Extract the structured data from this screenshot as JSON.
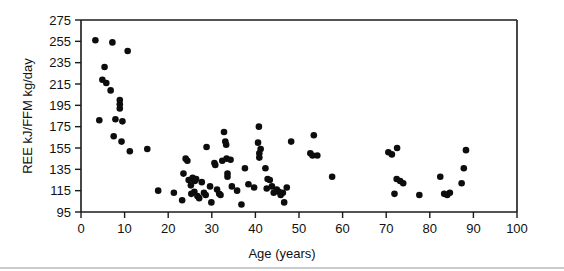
{
  "chart_data": {
    "type": "scatter",
    "title": "",
    "xlabel": "Age (years)",
    "ylabel": "REE kJ/FFM kg/day",
    "xlim": [
      0,
      100
    ],
    "ylim": [
      95,
      275
    ],
    "xticks": [
      0,
      10,
      20,
      30,
      40,
      50,
      60,
      70,
      80,
      90,
      100
    ],
    "yticks": [
      95,
      115,
      135,
      155,
      175,
      195,
      215,
      235,
      255,
      275
    ],
    "xtick_labels": [
      "0",
      "10",
      "20",
      "30",
      "40",
      "50",
      "60",
      "70",
      "80",
      "90",
      "100"
    ],
    "ytick_labels": [
      "95",
      "115",
      "135",
      "155",
      "175",
      "195",
      "215",
      "235",
      "255",
      "275"
    ],
    "grid": false,
    "legend": null,
    "marker": "filled-circle",
    "marker_color": "#0d0d0d",
    "points": [
      [
        3.3,
        256
      ],
      [
        7.2,
        254
      ],
      [
        10.7,
        246
      ],
      [
        5.4,
        231
      ],
      [
        4.9,
        219
      ],
      [
        5.8,
        216
      ],
      [
        6.8,
        209
      ],
      [
        8.9,
        200
      ],
      [
        8.9,
        196
      ],
      [
        8.9,
        192
      ],
      [
        7.9,
        182
      ],
      [
        4.2,
        181
      ],
      [
        9.5,
        180
      ],
      [
        7.5,
        166
      ],
      [
        9.3,
        161
      ],
      [
        11.2,
        152
      ],
      [
        15.2,
        154
      ],
      [
        17.7,
        115
      ],
      [
        21.3,
        113
      ],
      [
        23.2,
        106
      ],
      [
        23.5,
        131
      ],
      [
        24.0,
        145
      ],
      [
        24.4,
        143
      ],
      [
        24.7,
        125
      ],
      [
        25.2,
        120
      ],
      [
        25.6,
        127
      ],
      [
        25.8,
        126
      ],
      [
        26.1,
        124
      ],
      [
        26.4,
        126
      ],
      [
        26.0,
        114
      ],
      [
        25.3,
        112
      ],
      [
        26.7,
        110
      ],
      [
        27.1,
        108
      ],
      [
        27.7,
        123
      ],
      [
        28.2,
        113
      ],
      [
        28.6,
        111
      ],
      [
        28.8,
        156
      ],
      [
        29.6,
        119
      ],
      [
        29.9,
        104
      ],
      [
        30.6,
        141
      ],
      [
        30.8,
        139
      ],
      [
        31.2,
        116
      ],
      [
        31.7,
        112
      ],
      [
        32.0,
        111
      ],
      [
        32.4,
        143
      ],
      [
        32.8,
        170
      ],
      [
        33.1,
        161
      ],
      [
        33.3,
        158
      ],
      [
        33.4,
        145
      ],
      [
        33.6,
        131
      ],
      [
        33.6,
        128
      ],
      [
        34.3,
        144
      ],
      [
        34.6,
        119
      ],
      [
        35.8,
        115
      ],
      [
        36.8,
        102
      ],
      [
        37.6,
        136
      ],
      [
        38.4,
        121
      ],
      [
        39.7,
        118
      ],
      [
        40.6,
        160
      ],
      [
        40.8,
        175
      ],
      [
        40.9,
        146
      ],
      [
        40.9,
        150
      ],
      [
        41.2,
        154
      ],
      [
        42.3,
        136
      ],
      [
        42.6,
        117
      ],
      [
        42.8,
        126
      ],
      [
        43.3,
        125
      ],
      [
        43.8,
        119
      ],
      [
        44.2,
        113
      ],
      [
        44.9,
        116
      ],
      [
        45.4,
        114
      ],
      [
        45.8,
        111
      ],
      [
        46.3,
        113
      ],
      [
        46.6,
        104
      ],
      [
        47.2,
        118
      ],
      [
        48.2,
        161
      ],
      [
        52.6,
        150
      ],
      [
        53.1,
        148
      ],
      [
        53.4,
        167
      ],
      [
        54.2,
        148
      ],
      [
        57.6,
        128
      ],
      [
        70.5,
        151
      ],
      [
        71.3,
        149
      ],
      [
        72.5,
        155
      ],
      [
        71.9,
        112
      ],
      [
        72.4,
        126
      ],
      [
        73.2,
        124
      ],
      [
        73.9,
        122
      ],
      [
        77.6,
        111
      ],
      [
        82.4,
        128
      ],
      [
        83.3,
        112
      ],
      [
        84.0,
        111
      ],
      [
        84.6,
        113
      ],
      [
        87.3,
        122
      ],
      [
        87.8,
        136
      ],
      [
        88.3,
        153
      ]
    ]
  }
}
